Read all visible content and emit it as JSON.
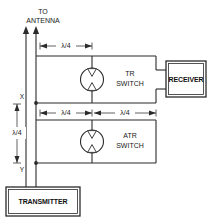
{
  "diagram": {
    "antenna_label_line1": "TO",
    "antenna_label_line2": "ANTENNA",
    "node_x_label": "X",
    "node_y_label": "Y",
    "dimensions": {
      "top_quarter_wave": "λ/4",
      "left_quarter_wave": "λ/4",
      "mid_left_quarter_wave": "λ/4",
      "mid_right_quarter_wave": "λ/4"
    },
    "switches": [
      {
        "id": "tr-switch",
        "label_line1": "TR",
        "label_line2": "SWITCH",
        "symbol": "spark-gap"
      },
      {
        "id": "atr-switch",
        "label_line1": "ATR",
        "label_line2": "SWITCH",
        "symbol": "spark-gap"
      }
    ],
    "boxes": [
      {
        "id": "receiver-box",
        "label": "RECEIVER"
      },
      {
        "id": "transmitter-box",
        "label": "TRANSMITTER"
      }
    ],
    "colors": {
      "line": "#2b2b2b",
      "text": "#1a1a1a",
      "background": "#ffffff"
    }
  }
}
